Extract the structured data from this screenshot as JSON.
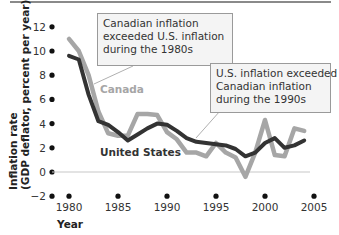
{
  "chart_data": {
    "type": "line",
    "title": "",
    "xlabel": "Year",
    "ylabel": "Inflation rate (GDP deflator, percent per year)",
    "ylabel_lines": [
      "Inflation rate",
      "(GDP deflator, percent per year)"
    ],
    "xlim": [
      1978.5,
      2006
    ],
    "ylim": [
      -2,
      12
    ],
    "x_ticks": [
      1980,
      1985,
      1990,
      1995,
      2000,
      2005
    ],
    "y_ticks": [
      -2,
      0,
      2,
      4,
      6,
      8,
      10,
      12
    ],
    "grid": false,
    "legend": "inline labels",
    "x": [
      1980,
      1981,
      1982,
      1983,
      1984,
      1985,
      1986,
      1987,
      1988,
      1989,
      1990,
      1991,
      1992,
      1993,
      1994,
      1995,
      1996,
      1997,
      1998,
      1999,
      2000,
      2001,
      2002,
      2003,
      2004
    ],
    "series": [
      {
        "name": "Canada",
        "color": "#a6a6a6",
        "values": [
          11.0,
          10.0,
          8.0,
          5.0,
          3.2,
          3.0,
          3.0,
          4.8,
          4.8,
          4.7,
          3.3,
          2.7,
          1.6,
          1.6,
          1.3,
          2.4,
          1.6,
          1.2,
          -0.4,
          1.6,
          4.3,
          1.4,
          1.3,
          3.6,
          3.4
        ]
      },
      {
        "name": "United States",
        "color": "#333333",
        "values": [
          9.6,
          9.3,
          6.4,
          4.2,
          3.9,
          3.3,
          2.6,
          3.1,
          3.6,
          4.0,
          3.9,
          3.4,
          2.8,
          2.5,
          2.4,
          2.3,
          2.2,
          1.9,
          1.3,
          1.6,
          2.4,
          2.8,
          2.0,
          2.2,
          2.6
        ]
      }
    ],
    "annotations": [
      {
        "text": [
          "Canadian inflation",
          "exceeded U.S. inflation",
          "during the 1980s"
        ],
        "points_to": {
          "x": 1982,
          "y": 7
        }
      },
      {
        "text": [
          "U.S. inflation exceeded",
          "Canadian inflation",
          "during the 1990s"
        ],
        "points_to": {
          "x": 1992,
          "y": 2.6
        }
      }
    ]
  },
  "labels": {
    "canada": "Canada",
    "united_states": "United States",
    "year": "Year",
    "ylabel_line1": "Inflation rate",
    "ylabel_line2": "(GDP deflator, percent per year)"
  },
  "notes": {
    "note_1980s": {
      "line1": "Canadian inflation",
      "line2": "exceeded U.S. inflation",
      "line3": "during the 1980s"
    },
    "note_1990s": {
      "line1": "U.S. inflation exceeded",
      "line2": "Canadian inflation",
      "line3": "during the 1990s"
    }
  },
  "colors": {
    "canada": "#a6a6a6",
    "united_states": "#333333",
    "zero_line": "#c8c8c8",
    "top_rule": "#8a8a8a"
  }
}
